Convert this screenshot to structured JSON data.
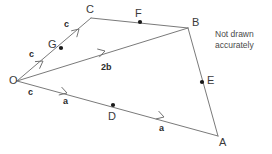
{
  "figure": {
    "note": "Not drawn\naccurately",
    "note_line1": "Not drawn",
    "note_line2": "accurately",
    "stroke_color": "#7a7a7a",
    "dot_color": "#1a1a1a",
    "text_color": "#2b2b2b",
    "background_color": "#ffffff"
  },
  "points": [
    {
      "id": "O",
      "label": "O",
      "x": 17,
      "y": 81,
      "label_x": 9,
      "label_y": 75,
      "marked": false
    },
    {
      "id": "G",
      "label": "G",
      "x": 61,
      "y": 48,
      "label_x": 48,
      "label_y": 39,
      "marked": true
    },
    {
      "id": "C",
      "label": "C",
      "x": 91,
      "y": 18,
      "label_x": 86,
      "label_y": 4,
      "marked": false
    },
    {
      "id": "F",
      "label": "F",
      "x": 140,
      "y": 22,
      "label_x": 135,
      "label_y": 8,
      "marked": true
    },
    {
      "id": "B",
      "label": "B",
      "x": 188,
      "y": 28,
      "label_x": 192,
      "label_y": 17,
      "marked": false
    },
    {
      "id": "E",
      "label": "E",
      "x": 202,
      "y": 82,
      "label_x": 207,
      "label_y": 75,
      "marked": true
    },
    {
      "id": "A",
      "label": "A",
      "x": 218,
      "y": 136,
      "label_x": 219,
      "label_y": 137,
      "marked": false
    },
    {
      "id": "D",
      "label": "D",
      "x": 113,
      "y": 105,
      "label_x": 108,
      "label_y": 111,
      "marked": true
    }
  ],
  "segments": [
    {
      "name": "O-to-C",
      "from": "O",
      "to": "C"
    },
    {
      "name": "C-to-B",
      "from": "C",
      "to": "B"
    },
    {
      "name": "O-to-B",
      "from": "O",
      "to": "B"
    },
    {
      "name": "B-to-A",
      "from": "B",
      "to": "A"
    },
    {
      "name": "O-to-A",
      "from": "O",
      "to": "A"
    }
  ],
  "vector_labels": [
    {
      "name": "c-lower",
      "text": "c",
      "x": 28,
      "y": 88
    },
    {
      "name": "c-middle",
      "text": "c",
      "x": 29,
      "y": 50
    },
    {
      "name": "c-upper",
      "text": "c",
      "x": 64,
      "y": 20
    },
    {
      "name": "two-b",
      "text": "2b",
      "x": 101,
      "y": 63
    },
    {
      "name": "a-first",
      "text": "a",
      "x": 63,
      "y": 97
    },
    {
      "name": "a-second",
      "text": "a",
      "x": 159,
      "y": 124
    }
  ],
  "arrow_markers": [
    {
      "name": "arrow-OG-c",
      "x": 43,
      "y": 61,
      "angle": -36
    },
    {
      "name": "arrow-GC-c",
      "x": 79,
      "y": 29,
      "angle": -45
    },
    {
      "name": "arrow-OB-2b",
      "x": 105,
      "y": 51,
      "angle": -17
    },
    {
      "name": "arrow-OD-a",
      "x": 67,
      "y": 93,
      "angle": 16
    },
    {
      "name": "arrow-DA-a",
      "x": 164,
      "y": 117,
      "angle": 16
    }
  ],
  "note_position": {
    "x": 215,
    "y": 29
  }
}
